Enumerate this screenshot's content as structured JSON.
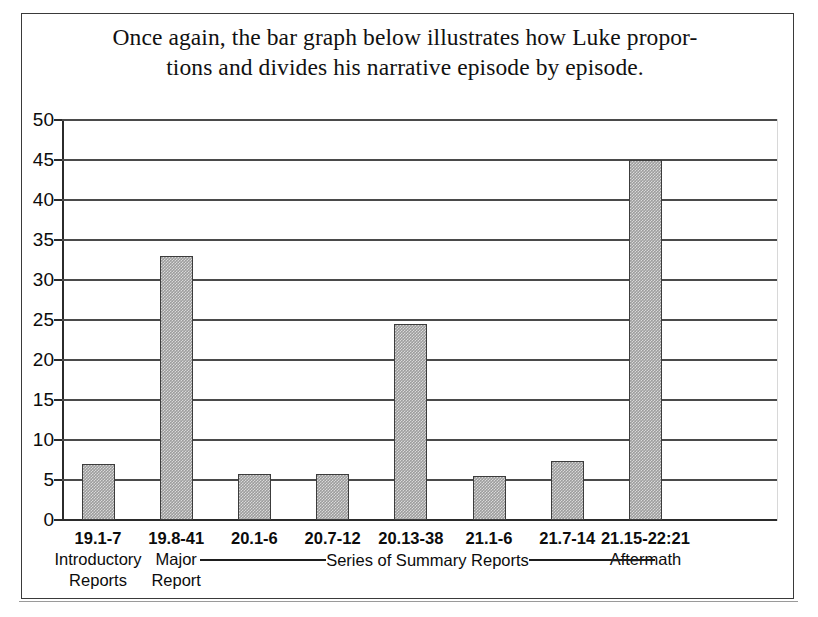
{
  "title": {
    "line1": "Once again, the bar graph below illustrates how Luke propor-",
    "line2": "tions and divides his narrative episode by episode."
  },
  "bracket": {
    "label": "Series of Summary Reports"
  },
  "chart_data": {
    "type": "bar",
    "xlabel": "",
    "ylabel": "",
    "ylim": [
      0,
      50
    ],
    "yticks": [
      0,
      5,
      10,
      15,
      20,
      25,
      30,
      35,
      40,
      45,
      50
    ],
    "ytick_labels": [
      "0",
      "5",
      "10",
      "15",
      "20",
      "25",
      "30",
      "35",
      "40",
      "45",
      "50"
    ],
    "grid": true,
    "legend": null,
    "bar_color": "#9d9d9d",
    "bar_edge_color": "#3c3c3c",
    "categories": [
      "19.1-7",
      "19.8-41",
      "20.1-6",
      "20.7-12",
      "20.13-38",
      "21.1-6",
      "21.7-14",
      "21.15-22:21"
    ],
    "category_descriptions": [
      "Introductory\nReports",
      "Major\nReport",
      "",
      "",
      "",
      "",
      "",
      "Aftermath"
    ],
    "values": [
      7,
      33,
      5.7,
      5.7,
      24.5,
      5.5,
      7.4,
      45
    ],
    "annotations": [
      {
        "text": "Series of Summary Reports",
        "note": "bracket spanning categories 20.1-6 through 21.7-14"
      }
    ]
  },
  "categories_detail": [
    {
      "code": "19.1-7",
      "desc1": "Introductory",
      "desc2": "Reports"
    },
    {
      "code": "19.8-41",
      "desc1": "Major",
      "desc2": "Report"
    },
    {
      "code": "20.1-6",
      "desc1": "",
      "desc2": ""
    },
    {
      "code": "20.7-12",
      "desc1": "",
      "desc2": ""
    },
    {
      "code": "20.13-38",
      "desc1": "",
      "desc2": ""
    },
    {
      "code": "21.1-6",
      "desc1": "",
      "desc2": ""
    },
    {
      "code": "21.7-14",
      "desc1": "",
      "desc2": ""
    },
    {
      "code": "21.15-22:21",
      "desc1": "Aftermath",
      "desc2": ""
    }
  ]
}
